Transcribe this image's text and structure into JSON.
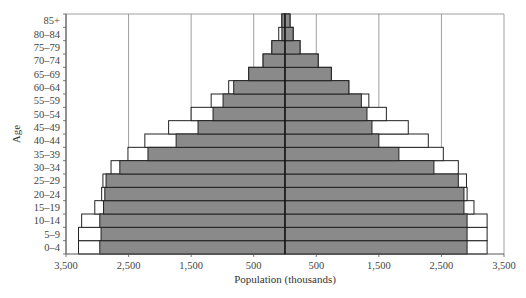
{
  "chart_data": {
    "type": "bar",
    "subtype": "population-pyramid",
    "title": "",
    "xlabel": "Population (thousands)",
    "ylabel": "Age",
    "xlim": [
      -3500,
      3500
    ],
    "x_tick_labels": [
      "3,500",
      "2,500",
      "1,500",
      "500",
      "500",
      "1,500",
      "2,500",
      "3,500"
    ],
    "x_tick_values": [
      -3500,
      -2500,
      -1500,
      -500,
      500,
      1500,
      2500,
      3500
    ],
    "grid": true,
    "legend": "none",
    "categories": [
      "0–4",
      "5–9",
      "10–14",
      "15–19",
      "20–24",
      "25–29",
      "30–34",
      "35–39",
      "40–44",
      "45–49",
      "50–54",
      "55–59",
      "60–64",
      "65–69",
      "70–74",
      "75–79",
      "80–84",
      "85+"
    ],
    "series": [
      {
        "name": "Left (filled)",
        "side": "left",
        "style": "gray",
        "values": [
          2960,
          2940,
          2960,
          2900,
          2880,
          2860,
          2640,
          2190,
          1740,
          1390,
          1150,
          990,
          820,
          580,
          350,
          210,
          50,
          50
        ]
      },
      {
        "name": "Left (outline)",
        "side": "left",
        "style": "white",
        "values": [
          3300,
          3300,
          3250,
          3040,
          2930,
          2910,
          2780,
          2510,
          2240,
          1860,
          1500,
          1180,
          900,
          580,
          350,
          210,
          100,
          50
        ]
      },
      {
        "name": "Right (filled)",
        "side": "right",
        "style": "gray",
        "values": [
          2910,
          2910,
          2910,
          2860,
          2860,
          2770,
          2380,
          1820,
          1500,
          1390,
          1310,
          1220,
          1020,
          740,
          530,
          240,
          130,
          80
        ]
      },
      {
        "name": "Right (outline)",
        "side": "right",
        "style": "white",
        "values": [
          3230,
          3230,
          3230,
          3020,
          2910,
          2900,
          2770,
          2530,
          2290,
          1970,
          1620,
          1340,
          1020,
          740,
          530,
          240,
          130,
          80
        ]
      }
    ],
    "colors": {
      "filled": "#8a8a8a",
      "outline": "#ffffff",
      "stroke": "#222222",
      "grid": "#888888"
    }
  }
}
